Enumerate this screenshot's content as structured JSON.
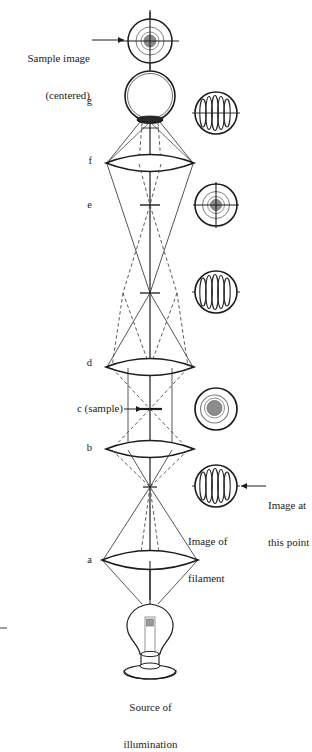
{
  "figure": {
    "type": "optical-ray-diagram",
    "background_color": "#ffffff",
    "line_color": "#1c1c1c",
    "ray_solid_color": "#2b2b2b",
    "ray_dashed_color": "#4a4a4a",
    "sample_fill_color": "#8c8c8c"
  },
  "labels": {
    "sample_image_line1": "Sample image",
    "sample_image_line2": "(centered)",
    "stage_g": "g",
    "stage_f": "f",
    "stage_e": "e",
    "stage_d": "d",
    "stage_c": "c (sample)",
    "stage_b": "b",
    "stage_a": "a",
    "image_at_line1": "Image at",
    "image_at_line2": "this point",
    "image_of_filament_line1": "Image of",
    "image_of_filament_line2": "filament",
    "source_line1": "Source of",
    "source_line2": "illumination"
  },
  "elements": {
    "insets": [
      {
        "name": "sample-image-inset-top",
        "kind": "sample-with-crosshair",
        "cx": 150,
        "cy": 41,
        "r": 22,
        "description": "concentric circles with gray core and crosshair"
      },
      {
        "name": "filament-inset-g",
        "kind": "filament-coil",
        "cx": 216,
        "cy": 113,
        "r": 21,
        "description": "circle with vertical coil lines: image of filament"
      },
      {
        "name": "sample-image-inset-e",
        "kind": "sample-with-crosshair",
        "cx": 216,
        "cy": 205,
        "r": 21,
        "description": "concentric circles with gray core and crosshair"
      },
      {
        "name": "filament-inset-mid",
        "kind": "filament-coil",
        "cx": 216,
        "cy": 292,
        "r": 21,
        "description": "circle with vertical coil lines: image of filament"
      },
      {
        "name": "sample-inset-c",
        "kind": "sample-plain",
        "cx": 216,
        "cy": 409,
        "r": 21,
        "description": "concentric circles with gray core, no crosshair"
      },
      {
        "name": "filament-inset-bottom",
        "kind": "filament-coil",
        "cx": 216,
        "cy": 486,
        "r": 21,
        "description": "circle with vertical coil lines: image at this point"
      }
    ],
    "lenses": [
      {
        "name": "lens-f",
        "cy": 163,
        "half_width": 44,
        "bulge": 12
      },
      {
        "name": "lens-d",
        "cy": 367,
        "half_width": 44,
        "bulge": 12
      },
      {
        "name": "lens-b",
        "cy": 449,
        "half_width": 44,
        "bulge": 12
      },
      {
        "name": "lens-a",
        "cy": 560,
        "half_width": 48,
        "bulge": 13
      }
    ],
    "focal_planes": [
      {
        "name": "plane-e",
        "cy": 205,
        "half_width": 10
      },
      {
        "name": "plane-mid-focus",
        "cy": 293,
        "half_width": 10
      },
      {
        "name": "plane-c-sample",
        "cy": 409,
        "half_width": 12
      },
      {
        "name": "plane-b-focus",
        "cy": 487,
        "half_width": 7
      }
    ],
    "eyepiece": {
      "name": "eyepiece-g",
      "cx": 150,
      "cy": 96,
      "r": 25
    },
    "lamp": {
      "name": "light-bulb",
      "cx": 150,
      "cy": 630
    },
    "optical_axis": {
      "x": 150,
      "y_top": 10,
      "y_bottom": 600
    }
  },
  "annotations": {
    "sample_image_arrow": {
      "from_x": 92,
      "to_x": 126,
      "y": 40
    },
    "c_sample_arrow": {
      "from_x": 124,
      "to_x": 144,
      "y": 409
    },
    "image_at_arrow": {
      "from_x": 266,
      "to_x": 240,
      "y": 486
    }
  }
}
